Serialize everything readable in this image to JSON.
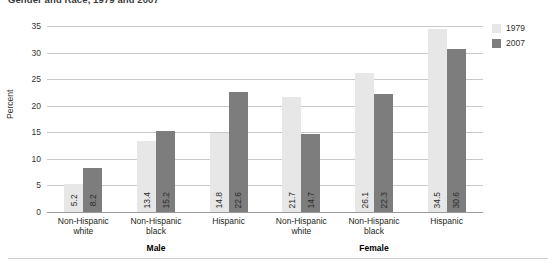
{
  "chart_data": {
    "type": "bar",
    "title": "Gender and Race, 1979 and 2007",
    "xlabel": "",
    "ylabel": "Percent",
    "ylim": [
      0,
      35
    ],
    "yticks": [
      "0",
      "5",
      "10",
      "15",
      "20",
      "25",
      "30",
      "35"
    ],
    "grid": true,
    "legend_position": "right",
    "categories": [
      "Non-Hispanic white",
      "Non-Hispanic black",
      "Hispanic",
      "Non-Hispanic white",
      "Non-Hispanic black",
      "Hispanic"
    ],
    "category_lines": [
      [
        "Non-Hispanic",
        "white"
      ],
      [
        "Non-Hispanic",
        "black"
      ],
      [
        "Hispanic",
        ""
      ],
      [
        "Non-Hispanic",
        "white"
      ],
      [
        "Non-Hispanic",
        "black"
      ],
      [
        "Hispanic",
        ""
      ]
    ],
    "group_labels": [
      "Male",
      "Female"
    ],
    "series": [
      {
        "name": "1979",
        "color": "#e7e7e7",
        "values": [
          5.2,
          13.4,
          14.8,
          21.7,
          26.1,
          34.5
        ]
      },
      {
        "name": "2007",
        "color": "#7d7d7d",
        "values": [
          8.2,
          15.2,
          22.6,
          14.7,
          22.3,
          30.6
        ]
      }
    ],
    "value_labels": [
      [
        "5.2",
        "8.2"
      ],
      [
        "13.4",
        "15.2"
      ],
      [
        "14.8",
        "22.6"
      ],
      [
        "21.7",
        "14.7"
      ],
      [
        "26.1",
        "22.3"
      ],
      [
        "34.5",
        "30.6"
      ]
    ]
  }
}
